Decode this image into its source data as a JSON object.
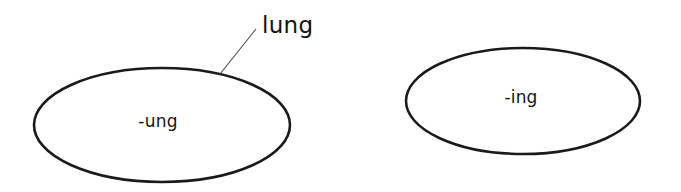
{
  "canvas": {
    "width": 681,
    "height": 192,
    "background_color": "#ffffff",
    "stroke_color": "#1a1a1a",
    "text_color": "#151515",
    "leader_color": "#4a4a4a"
  },
  "diagram": {
    "type": "labelled-ellipses",
    "nodes": [
      {
        "id": "ung-node",
        "label": "-ung",
        "cx": 162,
        "cy": 125,
        "rx": 128,
        "ry": 57,
        "label_x": 158,
        "label_y": 122
      },
      {
        "id": "ing-node",
        "label": "-ing",
        "cx": 523,
        "cy": 101,
        "rx": 117,
        "ry": 53,
        "label_x": 521,
        "label_y": 98
      }
    ],
    "callouts": [
      {
        "id": "lung-callout",
        "label": "lung",
        "text_x": 262,
        "text_y": 26,
        "line_x1": 220,
        "line_y1": 74,
        "line_x2": 256,
        "line_y2": 29,
        "target_node": "ung-node"
      }
    ]
  }
}
